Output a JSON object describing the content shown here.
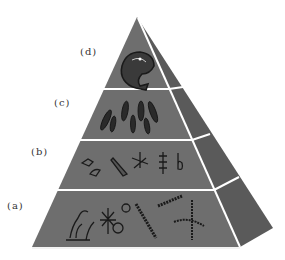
{
  "diagram": {
    "type": "trophic pyramid",
    "colors": {
      "front_face": "#6e6e6e",
      "side_face": "#5a5a5a",
      "divider": "#ffffff",
      "organism_ink": "#1a1a1a"
    },
    "levels": [
      {
        "label": "(d)",
        "content": "large predatory fish"
      },
      {
        "label": "(c)",
        "content": "school of small fish"
      },
      {
        "label": "(b)",
        "content": "zooplankton"
      },
      {
        "label": "(a)",
        "content": "phytoplankton / algae"
      }
    ]
  }
}
